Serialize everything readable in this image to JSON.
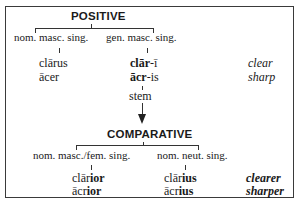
{
  "positive": {
    "heading": "POSITIVE",
    "left_label": "nom. masc. sing.",
    "right_label": "gen. masc. sing.",
    "left_forms": [
      "clārus",
      "ācer"
    ],
    "right_forms": [
      {
        "stem": "clār",
        "ending": "-ī"
      },
      {
        "stem": "ācr",
        "ending": "-is"
      }
    ],
    "glosses": [
      "clear",
      "sharp"
    ],
    "stem_label": "stem"
  },
  "comparative": {
    "heading": "COMPARATIVE",
    "left_label": "nom. masc./fem. sing.",
    "right_label": "nom. neut. sing.",
    "left_forms": [
      {
        "stem": "clār",
        "ending": "ior"
      },
      {
        "stem": "ācr",
        "ending": "ior"
      }
    ],
    "right_forms": [
      {
        "stem": "clār",
        "ending": "ius"
      },
      {
        "stem": "ācr",
        "ending": "ius"
      }
    ],
    "glosses": [
      "clearer",
      "sharper"
    ]
  }
}
